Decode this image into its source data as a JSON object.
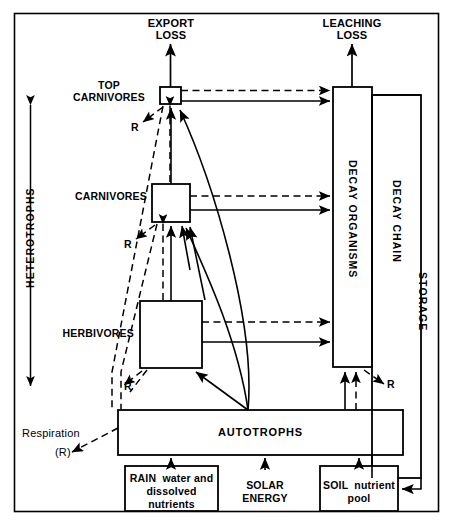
{
  "diagram": {
    "frame": {
      "x": 14,
      "y": 13,
      "width": 425,
      "height": 499
    }
  },
  "nodes": {
    "export_loss": "EXPORT\nLOSS",
    "leaching_loss": "LEACHING\nLOSS",
    "top_carnivores": "TOP\nCARNIVORES",
    "carnivores": "CARNIVORES",
    "herbivores": "HERBIVORES",
    "autotrophs": "AUTOTROPHS",
    "decay_organisms": "DECAY ORGANISMS",
    "decay_chain": "DECAY CHAIN",
    "rain": "RAIN  water and\ndissolved\nnutrients",
    "solar": "SOLAR\nENERGY",
    "soil": "SOIL  nutrient\npool"
  },
  "axis_labels": {
    "heterotrophs": "HETEROTROPHS",
    "storage": "STORAGE"
  },
  "respiration": {
    "word": "Respiration",
    "symbol": "(R)",
    "marks": [
      "R",
      "R",
      "R",
      "R"
    ]
  },
  "colors": {
    "ink": "#000000",
    "paper": "#ffffff"
  }
}
